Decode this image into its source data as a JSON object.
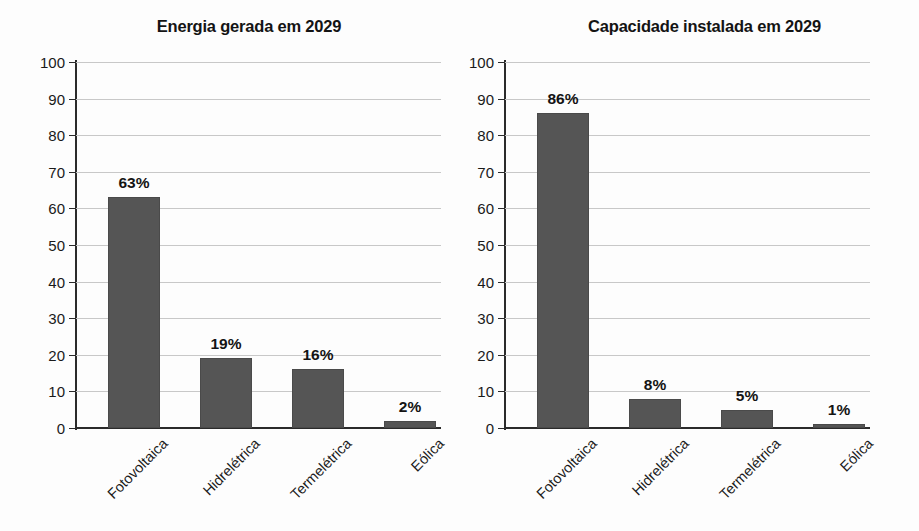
{
  "chart_data": [
    {
      "type": "bar",
      "title": "Energia gerada em 2029",
      "categories": [
        "Fotovoltaica",
        "Hidrelétrica",
        "Termelétrica",
        "Eólica"
      ],
      "values": [
        63,
        19,
        16,
        2
      ],
      "data_labels": [
        "63%",
        "19%",
        "16%",
        "2%"
      ],
      "xlabel": "",
      "ylabel": "",
      "ylim": [
        0,
        100
      ],
      "yticks": [
        0,
        10,
        20,
        30,
        40,
        50,
        60,
        70,
        80,
        90,
        100
      ],
      "ytick_labels": [
        "0",
        "10",
        "20",
        "30",
        "40",
        "50",
        "60",
        "70",
        "80",
        "90",
        "100"
      ],
      "grid": true,
      "legend": "none",
      "bar_color": "#555555",
      "grid_color": "#c8c8c8",
      "axis_color": "#2b2b2b"
    },
    {
      "type": "bar",
      "title": "Capacidade instalada em 2029",
      "categories": [
        "Fotovoltaica",
        "Hidrelétrica",
        "Termelétrica",
        "Eólica"
      ],
      "values": [
        86,
        8,
        5,
        1
      ],
      "data_labels": [
        "86%",
        "8%",
        "5%",
        "1%"
      ],
      "xlabel": "",
      "ylabel": "",
      "ylim": [
        0,
        100
      ],
      "yticks": [
        0,
        10,
        20,
        30,
        40,
        50,
        60,
        70,
        80,
        90,
        100
      ],
      "ytick_labels": [
        "0",
        "10",
        "20",
        "30",
        "40",
        "50",
        "60",
        "70",
        "80",
        "90",
        "100"
      ],
      "grid": true,
      "legend": "none",
      "bar_color": "#555555",
      "grid_color": "#c8c8c8",
      "axis_color": "#2b2b2b"
    }
  ]
}
